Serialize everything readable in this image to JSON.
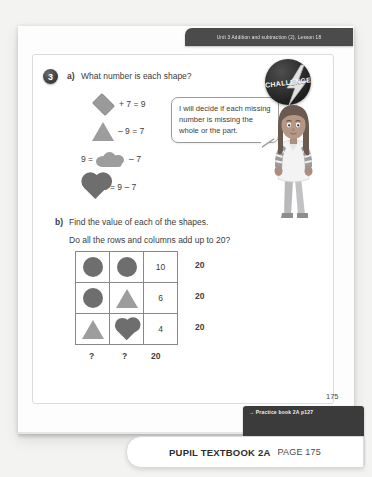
{
  "header": {
    "unit_banner": "Unit 3  Addition and subtraction (2), Lesson 18"
  },
  "question": {
    "number": "3",
    "part_a_label": "a)",
    "part_a_text": "What number is each shape?",
    "equations": [
      {
        "shape": "diamond",
        "text": "+ 7 = 9",
        "shape_position": "left"
      },
      {
        "shape": "triangle",
        "text": "– 9 = 7",
        "shape_position": "left"
      },
      {
        "shape": "cloud",
        "prefix": "9 =",
        "text": "– 7",
        "shape_position": "middle"
      },
      {
        "shape": "heart",
        "text": "= 9 – 7",
        "shape_position": "left"
      }
    ],
    "part_b_label": "b)",
    "part_b_text": "Find the value of each of the shapes.",
    "part_b_subtext": "Do all the rows and columns add up to 20?"
  },
  "speech_bubble": {
    "text": "I will decide if each missing number is missing the whole or the part."
  },
  "challenge_badge": {
    "label": "CHALLENGE",
    "icon": "lightning-bolt-icon"
  },
  "character": {
    "name": "girl-character",
    "hair_color": "#6b5a50",
    "shirt_color": "#f2f2f2"
  },
  "grid": {
    "rows": [
      {
        "cells": [
          "circle",
          "circle",
          "10"
        ],
        "total": "20"
      },
      {
        "cells": [
          "circle",
          "triangle",
          "6"
        ],
        "total": "20"
      },
      {
        "cells": [
          "triangle",
          "heart",
          "4"
        ],
        "total": "20"
      }
    ],
    "column_totals": [
      "?",
      "?",
      "20"
    ]
  },
  "footer": {
    "page_number": "175",
    "practice_tag": "→ Practice book 2A p127",
    "bottom_bar_title": "PUPIL TEXTBOOK 2A",
    "bottom_bar_page": "PAGE 175"
  },
  "colors": {
    "shape_dark": "#6e6e6e",
    "shape_light": "#9d9d9d",
    "banner_dark": "#4b4b4b",
    "text": "#3c3c3c"
  }
}
